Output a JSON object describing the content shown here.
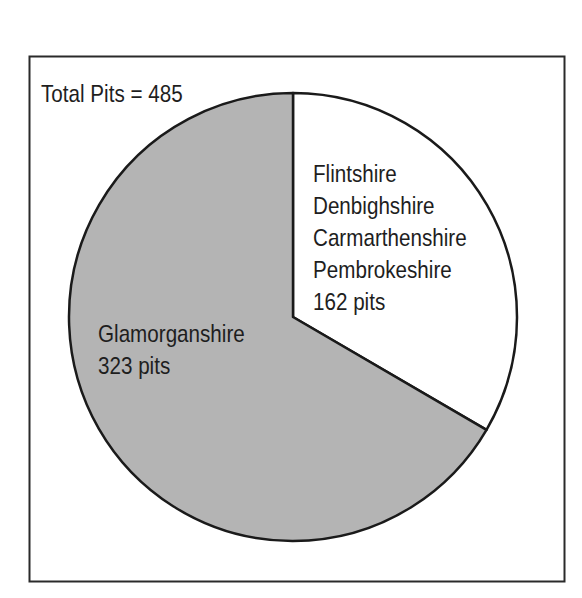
{
  "chart_data": {
    "type": "pie",
    "title": "",
    "annotation": "Total Pits = 485",
    "total": 485,
    "start": "top",
    "direction": "clockwise",
    "slices": [
      {
        "name": "Flintshire, Denbighshire, Carmarthenshire, Pembrokeshire",
        "value": 162,
        "label_lines": [
          "Flintshire",
          "Denbighshire",
          "Carmarthenshire",
          "Pembrokeshire",
          "162 pits"
        ],
        "color": "#ffffff"
      },
      {
        "name": "Glamorganshire",
        "value": 323,
        "label_lines": [
          "Glamorganshire",
          "323 pits"
        ],
        "color": "#b4b4b4"
      }
    ],
    "legend": "none"
  }
}
